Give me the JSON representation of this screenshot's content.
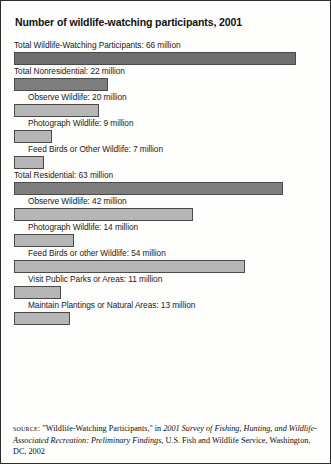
{
  "figure": {
    "title": "Number of wildlife-watching participants, 2001",
    "source": {
      "kicker": "source:",
      "pre_italic": " \"Wildlife-Watching Participants,\" in ",
      "italic": "2001 Survey of Fishing, Hunting, and Wildlife-Associated Recreation: Preliminary Findings,",
      "post_italic": " U.S. Fish and Wildlife Service, Washington, DC, 2002"
    }
  },
  "chart_data": {
    "type": "bar",
    "title": "Number of wildlife-watching participants, 2001",
    "xlabel": "",
    "ylabel": "",
    "unit": "million participants",
    "orientation": "horizontal",
    "grid": false,
    "legend": false,
    "xlim": [
      0,
      70
    ],
    "categories": [
      "Total Wildlife-Watching Participants",
      "Total Nonresidential",
      "Observe Wildlife",
      "Photograph Wildlife",
      "Feed Birds or Other Wildlife",
      "Total Residential",
      "Observe Wildlife",
      "Photograph Wildlife",
      "Feed Birds or other Wildlife",
      "Visit Public Parks or Areas",
      "Maintain Plantings or Natural Areas"
    ],
    "values": [
      66,
      22,
      20,
      9,
      7,
      63,
      42,
      14,
      54,
      11,
      13
    ],
    "bars": [
      {
        "label": "Total Wildlife-Watching Participants: 66 million",
        "category": "Total Wildlife-Watching Participants",
        "value": 66,
        "level": "grand",
        "indent": 0
      },
      {
        "label": "Total Nonresidential: 22 million",
        "category": "Total Nonresidential",
        "value": 22,
        "level": "total",
        "indent": 0
      },
      {
        "label": "Observe Wildlife: 20 million",
        "category": "Observe Wildlife",
        "value": 20,
        "level": "sub",
        "indent": 1
      },
      {
        "label": "Photograph Wildlife: 9 million",
        "category": "Photograph Wildlife",
        "value": 9,
        "level": "sub",
        "indent": 1
      },
      {
        "label": "Feed Birds or Other Wildlife: 7 million",
        "category": "Feed Birds or Other Wildlife",
        "value": 7,
        "level": "sub",
        "indent": 1
      },
      {
        "label": "Total Residential: 63 million",
        "category": "Total Residential",
        "value": 63,
        "level": "total",
        "indent": 0
      },
      {
        "label": "Observe Wildlife: 42 million",
        "category": "Observe Wildlife",
        "value": 42,
        "level": "sub",
        "indent": 1
      },
      {
        "label": "Photograph Wildlife: 14 million",
        "category": "Photograph Wildlife",
        "value": 14,
        "level": "sub",
        "indent": 1
      },
      {
        "label": "Feed Birds or other Wildlife: 54 million",
        "category": "Feed Birds or other Wildlife",
        "value": 54,
        "level": "sub",
        "indent": 1
      },
      {
        "label": "Visit Public Parks or Areas: 11 million",
        "category": "Visit Public Parks or Areas",
        "value": 11,
        "level": "sub",
        "indent": 1
      },
      {
        "label": "Maintain Plantings or Natural Areas: 13 million",
        "category": "Maintain Plantings or Natural Areas",
        "value": 13,
        "level": "sub",
        "indent": 1
      }
    ],
    "colors": {
      "bar_grand": "#6f6f6f",
      "bar_total": "#7e7e7e",
      "bar_sub": "#b6b6b6",
      "bar_border": "#4a4a4a",
      "text": "#1b1b1b",
      "frame": "#2b2b2b"
    }
  }
}
